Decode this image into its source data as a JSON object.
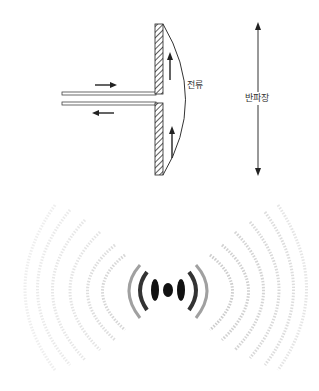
{
  "diagram": {
    "antenna": {
      "current_label": "전류",
      "half_wavelength_label": "반파장",
      "feed_arrows": [
        "right",
        "left"
      ],
      "current_arrows": [
        "up",
        "up"
      ]
    },
    "radiation_pattern": {
      "description": "dipole radiation interference pattern",
      "colors": {
        "core": "#111111",
        "rings": "#9a9a9a"
      }
    }
  }
}
